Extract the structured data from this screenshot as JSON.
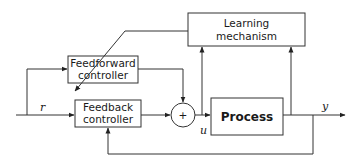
{
  "diagram": {
    "blocks": {
      "learning": {
        "line1": "Learning",
        "line2": "mechanism"
      },
      "feedforward": {
        "line1": "Feedforward",
        "line2": "controller"
      },
      "feedback": {
        "line1": "Feedback",
        "line2": "controller"
      },
      "process": {
        "label": "Process"
      },
      "sum": {
        "symbol": "+"
      }
    },
    "signals": {
      "reference": "r",
      "control": "u",
      "output": "y"
    },
    "connections": [
      {
        "from": "r",
        "to": "feedforward"
      },
      {
        "from": "r",
        "to": "feedback"
      },
      {
        "from": "feedforward",
        "to": "sum"
      },
      {
        "from": "feedback",
        "to": "sum"
      },
      {
        "from": "sum",
        "to": "process",
        "signal": "u"
      },
      {
        "from": "u",
        "to": "learning"
      },
      {
        "from": "y",
        "to": "learning"
      },
      {
        "from": "learning",
        "to": "feedforward",
        "style": "diagonal adjustment arrow"
      },
      {
        "from": "process",
        "to": "output",
        "signal": "y"
      },
      {
        "from": "y",
        "to": "feedback",
        "style": "feedback loop"
      }
    ]
  }
}
